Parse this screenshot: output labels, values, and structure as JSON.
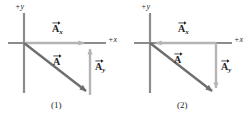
{
  "figure": {
    "name": "vector-components-two-cases",
    "background_color": "#ffffff",
    "colors": {
      "axis": "#8c8c8c",
      "component_vector": "#b5b5b5",
      "resultant_vector": "#6e6e6e",
      "text": "#222222"
    }
  },
  "panels": [
    {
      "id": "1",
      "caption": "(1)",
      "axis_labels": {
        "y": "+y",
        "x": "+x"
      },
      "vectors": [
        {
          "name": "A_x",
          "label_main": "A",
          "label_sub": "x",
          "direction": "right",
          "role": "x-component"
        },
        {
          "name": "A",
          "label_main": "A",
          "label_sub": "",
          "direction": "down-right",
          "role": "resultant"
        },
        {
          "name": "A_y",
          "label_main": "A",
          "label_sub": "y",
          "direction": "up",
          "role": "y-component"
        }
      ]
    },
    {
      "id": "2",
      "caption": "(2)",
      "axis_labels": {
        "y": "+y",
        "x": "+x"
      },
      "vectors": [
        {
          "name": "A_x",
          "label_main": "A",
          "label_sub": "x",
          "direction": "left",
          "role": "x-component"
        },
        {
          "name": "A",
          "label_main": "A",
          "label_sub": "",
          "direction": "down-right",
          "role": "resultant"
        },
        {
          "name": "A_y",
          "label_main": "A",
          "label_sub": "y",
          "direction": "down",
          "role": "y-component"
        }
      ]
    }
  ]
}
